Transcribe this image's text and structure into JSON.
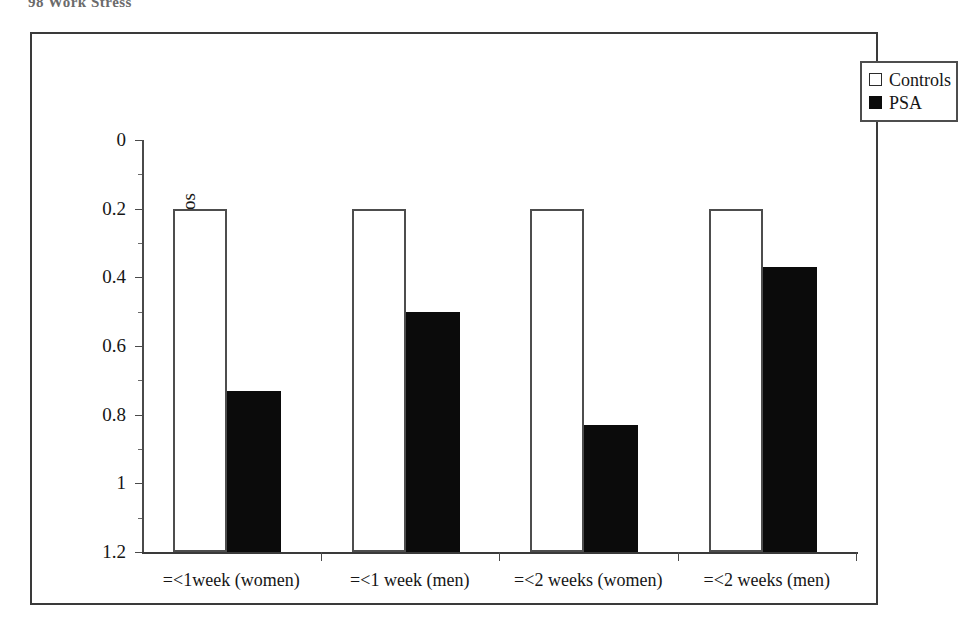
{
  "page": {
    "header_text": "98      Work Stress"
  },
  "legend": {
    "position": "top-right",
    "entries": [
      {
        "label": "Controls",
        "swatch": "white-square",
        "color": "#ffffff"
      },
      {
        "label": "PSA",
        "swatch": "black-square",
        "color": "#0b0b0b"
      }
    ]
  },
  "axes": {
    "y_title": "odds ratios",
    "y_ticks": [
      "1.2",
      "1",
      "0.8",
      "0.6",
      "0.4",
      "0.2",
      "0"
    ]
  },
  "chart_data": {
    "type": "bar",
    "title": "",
    "xlabel": "",
    "ylabel": "odds ratios",
    "ylim": [
      0,
      1.2
    ],
    "ytick_values": [
      0,
      0.2,
      0.4,
      0.6,
      0.8,
      1,
      1.2
    ],
    "grid": false,
    "legend_position": "top-right",
    "categories": [
      "=<1week (women)",
      "=<1 week (men)",
      "=<2 weeks (women)",
      "=<2 weeks (men)"
    ],
    "series": [
      {
        "name": "Controls",
        "color": "#ffffff",
        "values": [
          1,
          1,
          1,
          1
        ]
      },
      {
        "name": "PSA",
        "color": "#0b0b0b",
        "values": [
          0.47,
          0.7,
          0.37,
          0.83
        ]
      }
    ]
  }
}
